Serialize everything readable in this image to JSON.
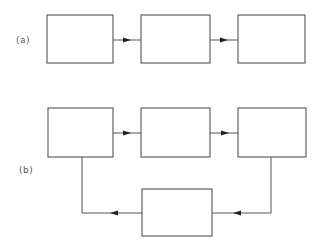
{
  "diagram": {
    "colors": {
      "stroke": "#555555",
      "arrowhead": "#222222",
      "background": "#ffffff"
    },
    "panel_a": {
      "label": "(a)",
      "boxes": [
        {
          "id": "a1",
          "x": 47,
          "y": 15,
          "w": 66,
          "h": 48
        },
        {
          "id": "a2",
          "x": 141,
          "y": 15,
          "w": 69,
          "h": 48
        },
        {
          "id": "a3",
          "x": 238,
          "y": 15,
          "w": 67,
          "h": 48
        }
      ],
      "arrows": [
        {
          "from": "a1",
          "to": "a2",
          "direction": "right"
        },
        {
          "from": "a2",
          "to": "a3",
          "direction": "right"
        }
      ]
    },
    "panel_b": {
      "label": "(b)",
      "boxes": [
        {
          "id": "b1",
          "x": 48,
          "y": 108,
          "w": 65,
          "h": 49
        },
        {
          "id": "b2",
          "x": 141,
          "y": 108,
          "w": 69,
          "h": 49
        },
        {
          "id": "b3",
          "x": 238,
          "y": 108,
          "w": 68,
          "h": 49
        },
        {
          "id": "b4",
          "x": 142,
          "y": 189,
          "w": 70,
          "h": 47
        }
      ],
      "arrows": [
        {
          "from": "b1",
          "to": "b2",
          "direction": "right"
        },
        {
          "from": "b2",
          "to": "b3",
          "direction": "right"
        },
        {
          "from": "b3",
          "to": "b4",
          "direction": "down-then-left"
        },
        {
          "from": "b4",
          "to": "b1",
          "direction": "left-then-up"
        }
      ]
    }
  }
}
